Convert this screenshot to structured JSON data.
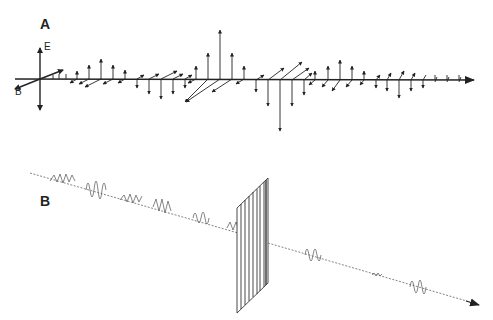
{
  "panel_a": {
    "label": "A",
    "e_axis_label": "E",
    "b_axis_label": "B"
  },
  "panel_b": {
    "label": "B"
  },
  "colors": {
    "ink": "#222222",
    "faint": "#777777",
    "background": "#ffffff"
  }
}
